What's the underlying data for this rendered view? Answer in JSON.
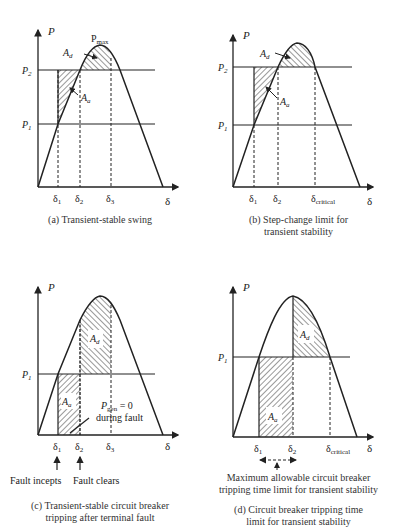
{
  "panels": [
    {
      "id": "a",
      "caption": "(a) Transient-stable swing",
      "axis_y": "P",
      "axis_x": "δ",
      "levels": [
        "P2",
        "P1"
      ],
      "level_labels": {
        "p2": "P",
        "p2_sub": "2",
        "p1": "P",
        "p1_sub": "1"
      },
      "peak_label": {
        "main": "P",
        "sub": "max"
      },
      "area_labels": {
        "ad": "A",
        "ad_sub": "d",
        "aa": "A",
        "aa_sub": "a"
      },
      "x_ticks": [
        {
          "main": "δ",
          "sub": "1"
        },
        {
          "main": "δ",
          "sub": "2"
        },
        {
          "main": "δ",
          "sub": "3"
        }
      ]
    },
    {
      "id": "b",
      "caption_line1": "(b) Step-change limit for",
      "caption_line2": "transient stability",
      "axis_y": "P",
      "axis_x": "δ",
      "level_labels": {
        "p2": "P",
        "p2_sub": "2",
        "p1": "P",
        "p1_sub": "1"
      },
      "area_labels": {
        "ad": "A",
        "ad_sub": "d",
        "aa": "A",
        "aa_sub": "a"
      },
      "x_ticks": [
        {
          "main": "δ",
          "sub": "1"
        },
        {
          "main": "δ",
          "sub": "2"
        },
        {
          "main": "δ",
          "sub": "critical"
        }
      ]
    },
    {
      "id": "c",
      "caption_line1": "(c) Transient-stable circuit breaker",
      "caption_line2": "tripping after terminal fault",
      "axis_y": "P",
      "axis_x": "δ",
      "level_labels": {
        "p1": "P",
        "p1_sub": "1"
      },
      "area_labels": {
        "ad": "A",
        "ad_sub": "d",
        "aa": "A",
        "aa_sub": "a"
      },
      "pgen_note": {
        "main": "P",
        "sub": "gen",
        "rest": " = 0",
        "line2": "during fault"
      },
      "x_ticks": [
        {
          "main": "δ",
          "sub": "1"
        },
        {
          "main": "δ",
          "sub": "2"
        },
        {
          "main": "δ",
          "sub": "3"
        }
      ],
      "events": [
        "Fault incepts",
        "Fault clears"
      ]
    },
    {
      "id": "d",
      "caption_line1": "(d) Circuit breaker tripping time",
      "caption_line2": "limit for transient stability",
      "axis_y": "P",
      "axis_x": "δ",
      "level_labels": {
        "p1": "P",
        "p1_sub": "1"
      },
      "area_labels": {
        "ad": "A",
        "ad_sub": "d",
        "aa": "A",
        "aa_sub": "a"
      },
      "x_ticks": [
        {
          "main": "δ",
          "sub": "1"
        },
        {
          "main": "δ",
          "sub": "2"
        },
        {
          "main": "δ",
          "sub": "critical"
        }
      ],
      "note_line1": "Maximum allowable circuit breaker",
      "note_line2": "tripping time limit for transient stability"
    }
  ]
}
